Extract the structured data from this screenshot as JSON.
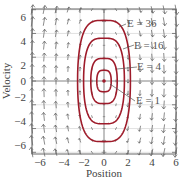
{
  "chart_data": {
    "type": "line",
    "subtype": "phase-portrait-with-vector-field",
    "title": "",
    "xlabel": "Position",
    "ylabel": "Velocity",
    "xlim": [
      -7,
      7
    ],
    "ylim": [
      -7,
      7
    ],
    "xticks": [
      -6,
      -4,
      -2,
      0,
      2,
      4,
      6
    ],
    "yticks": [
      -6,
      -4,
      -2,
      0,
      2,
      4,
      6
    ],
    "grid": true,
    "grid_lines": [
      -6,
      -4,
      -2,
      0,
      2,
      4,
      6
    ],
    "curve_color": "#9e1b2a",
    "arrow_color": "#555555",
    "series": [
      {
        "name": "E = 36",
        "label": "E = 36",
        "x_extent": 2.2,
        "v_extent": 5.1
      },
      {
        "name": "E = 16",
        "label": "E = 16",
        "x_extent": 1.7,
        "v_extent": 3.6
      },
      {
        "name": "E = 4",
        "label": "E = 4",
        "x_extent": 1.1,
        "v_extent": 1.9
      },
      {
        "name": "E = 1",
        "label": "E = 1",
        "x_extent": 0.6,
        "v_extent": 0.9
      }
    ],
    "vector_field": {
      "x": [
        -6,
        -5,
        -4,
        -3,
        -2,
        -1,
        0,
        1,
        2,
        3,
        4,
        5,
        6
      ],
      "v": [
        -6,
        -5,
        -4,
        -3,
        -2,
        -1,
        0,
        1,
        2,
        3,
        4,
        5,
        6
      ],
      "direction": "up for x<0, down for x>0, magnitude grows with |x|"
    },
    "annotations": [
      {
        "text": "E = 36",
        "points_to": "outer curve"
      },
      {
        "text": "E = 16",
        "points_to": "second curve"
      },
      {
        "text": "E = 4",
        "points_to": "third curve"
      },
      {
        "text": "E = 1",
        "points_to": "inner curve"
      }
    ]
  },
  "labels": {
    "xlabel": "Position",
    "ylabel": "Velocity",
    "xticks": [
      "−6",
      "−4",
      "−2",
      "0",
      "2",
      "4",
      "6"
    ],
    "yticks": [
      "6",
      "4",
      "2",
      "0",
      "−2",
      "−4",
      "−6"
    ],
    "energy": [
      "E = 36",
      "E = 16",
      "E = 4",
      "E = 1"
    ]
  }
}
